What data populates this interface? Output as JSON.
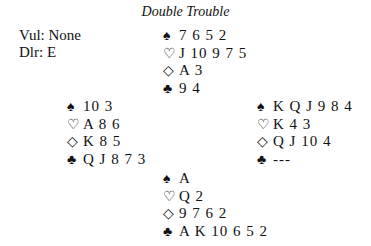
{
  "title": "Double Trouble",
  "meta": {
    "vul": "Vul: None",
    "dlr": "Dlr: E"
  },
  "suits": {
    "spades": "♠",
    "hearts": "♡",
    "diamonds": "◇",
    "clubs": "♣"
  },
  "hands": {
    "north": {
      "spades": "7 6 5 2",
      "hearts": "J 10 9 7 5",
      "diamonds": "A 3",
      "clubs": "9 4"
    },
    "west": {
      "spades": "10 3",
      "hearts": "A 8 6",
      "diamonds": "K 8 5",
      "clubs": "Q J 8 7 3"
    },
    "east": {
      "spades": "K Q J 9 8 4",
      "hearts": "K 4 3",
      "diamonds": "Q J 10 4",
      "clubs": "---"
    },
    "south": {
      "spades": "A",
      "hearts": "Q 2",
      "diamonds": "9 7 6 2",
      "clubs": "A K 10 6 5 2"
    }
  }
}
